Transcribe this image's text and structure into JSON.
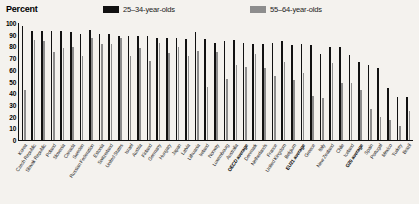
{
  "header": {
    "y_axis_title": "Percent",
    "legend": [
      {
        "key": "a",
        "label": "25–34-year-olds",
        "color": "#111111"
      },
      {
        "key": "b",
        "label": "55–64-year-olds",
        "color": "#8d8d8d"
      }
    ]
  },
  "chart_data": {
    "type": "bar",
    "title": "Percent",
    "xlabel": "",
    "ylabel": "Percent",
    "ylim": [
      0,
      100
    ],
    "yticks": [
      0,
      10,
      20,
      30,
      40,
      50,
      60,
      70,
      80,
      90,
      100
    ],
    "grid": false,
    "legend_position": "top",
    "highlight_bold_categories": [
      "OECD average",
      "EU21 average",
      "G20 average"
    ],
    "categories": [
      "Korea",
      "Czech Republic",
      "Slovak Republic",
      "Poland",
      "Slovenia",
      "Canada",
      "Sweden",
      "Russian Federation",
      "Estonia",
      "Switzerland",
      "United States",
      "Israel",
      "Austria",
      "Finland",
      "Germany",
      "Hungary",
      "Japan",
      "Latvia",
      "Lithuania",
      "Ireland",
      "Norway",
      "Luxembourg",
      "Australia",
      "OECD average",
      "Denmark",
      "Netherlands",
      "France",
      "United Kingdom",
      "Belgium",
      "EU21 average",
      "Greece",
      "Italy",
      "New Zealand",
      "Chile",
      "Iceland",
      "G20 average",
      "Spain",
      "Portugal",
      "Mexico",
      "Turkey",
      "Brazil"
    ],
    "series": [
      {
        "name": "25–34-year-olds",
        "color": "#111111",
        "values": [
          98,
          94,
          94,
          94,
          94,
          93,
          91,
          95,
          91,
          91,
          90,
          90,
          90,
          90,
          88,
          88,
          88,
          87,
          93,
          87,
          84,
          85,
          86,
          84,
          83,
          83,
          84,
          85,
          82,
          83,
          82,
          74,
          80,
          80,
          73,
          67,
          65,
          62,
          45,
          37,
          37
        ]
      },
      {
        "name": "55–64-year-olds",
        "color": "#8d8d8d",
        "values": [
          43,
          86,
          85,
          76,
          79,
          80,
          72,
          88,
          83,
          83,
          88,
          72,
          79,
          68,
          84,
          75,
          80,
          72,
          77,
          46,
          76,
          53,
          65,
          63,
          74,
          62,
          55,
          67,
          52,
          58,
          38,
          36,
          66,
          49,
          49,
          43,
          27,
          20,
          17,
          12,
          25
        ]
      }
    ]
  }
}
